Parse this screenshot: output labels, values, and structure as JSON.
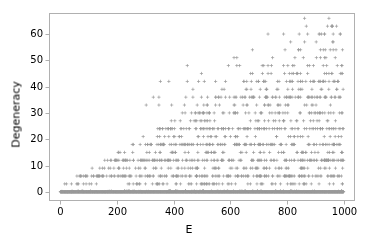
{
  "figure": {
    "width": 378,
    "height": 250,
    "background": "#ffffff",
    "axes_rect": {
      "left": 49,
      "top": 13,
      "right": 355,
      "bottom": 201
    },
    "frame_color": "#b0b0b0",
    "tick_color": "#b0b0b0",
    "text_color": "#000000"
  },
  "axis": {
    "xlabel": "E",
    "ylabel": "Degeneracy"
  },
  "chart_data": {
    "type": "scatter",
    "title": "",
    "xlabel": "E",
    "ylabel": "Degeneracy",
    "xlim": [
      -40,
      1040
    ],
    "ylim": [
      -3.5,
      68
    ],
    "xticks": [
      0,
      200,
      400,
      600,
      800,
      1000
    ],
    "xticklabels": [
      "0",
      "200",
      "400",
      "600",
      "800",
      "1000"
    ],
    "yticks": [
      0,
      10,
      20,
      30,
      40,
      50,
      60
    ],
    "yticklabels": [
      "0",
      "10",
      "20",
      "30",
      "40",
      "50",
      "60"
    ],
    "grid": false,
    "legend": null,
    "marker": "+",
    "marker_size": 1.6,
    "marker_color": "#9a9a9a",
    "bands": [
      0,
      3,
      6,
      9,
      12,
      15,
      18,
      21,
      24,
      27,
      30,
      33,
      36,
      39,
      42,
      45,
      48,
      51,
      54,
      57,
      60,
      63,
      66
    ],
    "envelope": {
      "slope": 0.066,
      "intercept": 2.0,
      "note": "max degeneracy at energy E is approximately 0.066*E + 2"
    },
    "series": [
      {
        "name": "degeneracy",
        "band_extents": [
          {
            "degeneracy": 0,
            "x_min": 0,
            "x_max": 1000,
            "density": 1.0
          },
          {
            "degeneracy": 3,
            "x_min": 10,
            "x_max": 1000,
            "density": 0.28
          },
          {
            "degeneracy": 6,
            "x_min": 18,
            "x_max": 1000,
            "density": 0.62
          },
          {
            "degeneracy": 9,
            "x_min": 40,
            "x_max": 1000,
            "density": 0.3
          },
          {
            "degeneracy": 12,
            "x_min": 55,
            "x_max": 1000,
            "density": 0.6
          },
          {
            "degeneracy": 15,
            "x_min": 85,
            "x_max": 1000,
            "density": 0.26
          },
          {
            "degeneracy": 18,
            "x_min": 95,
            "x_max": 1000,
            "density": 0.55
          },
          {
            "degeneracy": 21,
            "x_min": 130,
            "x_max": 1000,
            "density": 0.2
          },
          {
            "degeneracy": 24,
            "x_min": 150,
            "x_max": 1000,
            "density": 0.5
          },
          {
            "degeneracy": 27,
            "x_min": 195,
            "x_max": 1000,
            "density": 0.2
          },
          {
            "degeneracy": 30,
            "x_min": 205,
            "x_max": 1000,
            "density": 0.38
          },
          {
            "degeneracy": 33,
            "x_min": 300,
            "x_max": 1000,
            "density": 0.16
          },
          {
            "degeneracy": 36,
            "x_min": 325,
            "x_max": 1000,
            "density": 0.32
          },
          {
            "degeneracy": 39,
            "x_min": 345,
            "x_max": 1000,
            "density": 0.13
          },
          {
            "degeneracy": 42,
            "x_min": 350,
            "x_max": 1000,
            "density": 0.24
          },
          {
            "degeneracy": 45,
            "x_min": 450,
            "x_max": 1000,
            "density": 0.1
          },
          {
            "degeneracy": 48,
            "x_min": 455,
            "x_max": 1000,
            "density": 0.17
          },
          {
            "degeneracy": 51,
            "x_min": 610,
            "x_max": 1000,
            "density": 0.08
          },
          {
            "degeneracy": 54,
            "x_min": 680,
            "x_max": 1000,
            "density": 0.09
          },
          {
            "degeneracy": 57,
            "x_min": 730,
            "x_max": 1000,
            "density": 0.05
          },
          {
            "degeneracy": 60,
            "x_min": 735,
            "x_max": 1000,
            "density": 0.09
          },
          {
            "degeneracy": 63,
            "x_min": 865,
            "x_max": 1000,
            "density": 0.03
          },
          {
            "degeneracy": 66,
            "x_min": 860,
            "x_max": 975,
            "density": 0.02
          }
        ],
        "sparse_points": [
          [
            862,
            66
          ],
          [
            948,
            66
          ],
          [
            868,
            63
          ],
          [
            943,
            63
          ],
          [
            733,
            60
          ],
          [
            788,
            60
          ],
          [
            843,
            60
          ],
          [
            873,
            60
          ],
          [
            913,
            60
          ],
          [
            933,
            60
          ],
          [
            963,
            60
          ],
          [
            988,
            60
          ],
          [
            813,
            57
          ],
          [
            903,
            57
          ],
          [
            678,
            54
          ],
          [
            928,
            54
          ],
          [
            963,
            54
          ],
          [
            973,
            54
          ],
          [
            613,
            51
          ],
          [
            623,
            51
          ],
          [
            828,
            51
          ],
          [
            918,
            51
          ],
          [
            933,
            51
          ],
          [
            448,
            48
          ],
          [
            593,
            48
          ],
          [
            623,
            48
          ],
          [
            633,
            48
          ],
          [
            718,
            48
          ],
          [
            733,
            48
          ],
          [
            788,
            48
          ],
          [
            803,
            48
          ],
          [
            873,
            48
          ],
          [
            893,
            48
          ],
          [
            498,
            45
          ],
          [
            678,
            45
          ],
          [
            823,
            45
          ],
          [
            838,
            45
          ],
          [
            873,
            45
          ],
          [
            933,
            45
          ],
          [
            948,
            45
          ],
          [
            958,
            45
          ],
          [
            353,
            42
          ],
          [
            383,
            42
          ],
          [
            448,
            42
          ],
          [
            488,
            42
          ],
          [
            508,
            42
          ],
          [
            548,
            42
          ],
          [
            583,
            42
          ],
          [
            648,
            42
          ],
          [
            658,
            42
          ],
          [
            798,
            42
          ],
          [
            813,
            42
          ],
          [
            848,
            42
          ],
          [
            883,
            42
          ],
          [
            918,
            42
          ],
          [
            963,
            42
          ],
          [
            978,
            42
          ],
          [
            468,
            39
          ],
          [
            673,
            39
          ],
          [
            768,
            39
          ],
          [
            803,
            39
          ],
          [
            853,
            39
          ],
          [
            888,
            39
          ],
          [
            923,
            39
          ],
          [
            998,
            39
          ],
          [
            328,
            36
          ],
          [
            348,
            36
          ],
          [
            443,
            36
          ],
          [
            468,
            36
          ],
          [
            498,
            36
          ],
          [
            583,
            36
          ],
          [
            613,
            36
          ],
          [
            643,
            36
          ],
          [
            678,
            36
          ],
          [
            703,
            36
          ],
          [
            728,
            36
          ],
          [
            748,
            36
          ],
          [
            773,
            36
          ],
          [
            798,
            36
          ],
          [
            848,
            36
          ],
          [
            873,
            36
          ],
          [
            898,
            36
          ],
          [
            938,
            36
          ],
          [
            968,
            36
          ],
          [
            303,
            33
          ],
          [
            348,
            33
          ],
          [
            393,
            33
          ],
          [
            438,
            33
          ],
          [
            483,
            33
          ],
          [
            548,
            33
          ],
          [
            613,
            33
          ],
          [
            658,
            33
          ],
          [
            693,
            33
          ],
          [
            733,
            33
          ]
        ]
      }
    ]
  }
}
